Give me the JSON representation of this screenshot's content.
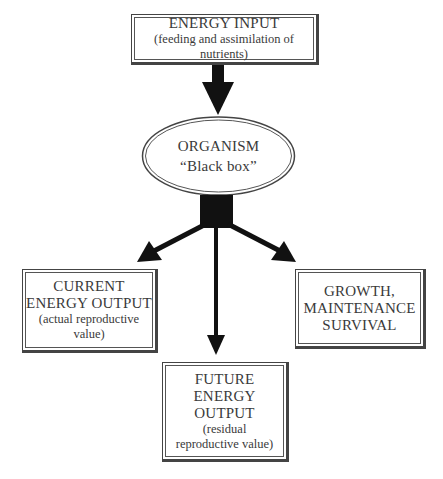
{
  "energy_input": {
    "title": "ENERGY INPUT",
    "subtitle": "(feeding and assimilation of nutrients)"
  },
  "organism": {
    "title": "ORGANISM",
    "subtitle": "“Black box”"
  },
  "current_output": {
    "line1": "CURRENT",
    "line2": "ENERGY OUTPUT",
    "sub1": "(actual reproductive",
    "sub2": "value)"
  },
  "growth": {
    "line1": "GROWTH,",
    "line2": "MAINTENANCE",
    "line3": "SURVIVAL"
  },
  "future_output": {
    "line1": "FUTURE",
    "line2": "ENERGY",
    "line3": "OUTPUT",
    "sub1": "(residual",
    "sub2": "reproductive value)"
  },
  "colors": {
    "arrow": "#111111",
    "border": "#444444",
    "text": "#3a3a3a"
  }
}
